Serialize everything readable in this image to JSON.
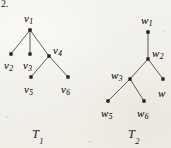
{
  "figure": {
    "item_number": "2.",
    "background_color": "#f2f0ea",
    "ink_color": "#24221f",
    "width": 171,
    "height": 148,
    "caption_left": "T",
    "caption_left_sub": "1",
    "caption_right": "T",
    "caption_right_sub": "2"
  },
  "trees": [
    {
      "id": "T1",
      "name_base": "T",
      "name_sub": "1",
      "name_x": 32,
      "name_y": 128,
      "nodes": [
        {
          "id": "v1",
          "base": "v",
          "sub": "1",
          "x": 30,
          "y": 30,
          "label_x": 24,
          "label_y": 13,
          "dot": 2.0
        },
        {
          "id": "v2",
          "base": "v",
          "sub": "2",
          "x": 11,
          "y": 54,
          "label_x": 4,
          "label_y": 60,
          "dot": 1.9
        },
        {
          "id": "v3",
          "base": "v",
          "sub": "3",
          "x": 30,
          "y": 54,
          "label_x": 23,
          "label_y": 60,
          "dot": 1.9
        },
        {
          "id": "v4",
          "base": "v",
          "sub": "4",
          "x": 49,
          "y": 56,
          "label_x": 53,
          "label_y": 45,
          "dot": 1.9
        },
        {
          "id": "v5",
          "base": "v",
          "sub": "5",
          "x": 31,
          "y": 77,
          "label_x": 24,
          "label_y": 84,
          "dot": 1.9
        },
        {
          "id": "v6",
          "base": "v",
          "sub": "6",
          "x": 68,
          "y": 77,
          "label_x": 61,
          "label_y": 84,
          "dot": 1.9
        }
      ],
      "edges": [
        {
          "from": "v1",
          "to": "v2"
        },
        {
          "from": "v1",
          "to": "v3"
        },
        {
          "from": "v1",
          "to": "v4"
        },
        {
          "from": "v4",
          "to": "v5"
        },
        {
          "from": "v4",
          "to": "v6"
        }
      ]
    },
    {
      "id": "T2",
      "name_base": "T",
      "name_sub": "2",
      "name_x": 128,
      "name_y": 128,
      "nodes": [
        {
          "id": "w1",
          "base": "w",
          "sub": "1",
          "x": 148,
          "y": 32,
          "label_x": 141,
          "label_y": 15,
          "dot": 2.0
        },
        {
          "id": "w2",
          "base": "w",
          "sub": "2",
          "x": 148,
          "y": 59,
          "label_x": 152,
          "label_y": 48,
          "dot": 1.9
        },
        {
          "id": "w3",
          "base": "w",
          "sub": "3",
          "x": 130,
          "y": 79,
          "label_x": 111,
          "label_y": 70,
          "dot": 1.9
        },
        {
          "id": "w4",
          "base": "w",
          "sub": "",
          "x": 163,
          "y": 79,
          "label_x": 158,
          "label_y": 88,
          "dot": 1.9
        },
        {
          "id": "w5",
          "base": "w",
          "sub": "5",
          "x": 108,
          "y": 101,
          "label_x": 101,
          "label_y": 108,
          "dot": 1.9
        },
        {
          "id": "w6",
          "base": "w",
          "sub": "6",
          "x": 144,
          "y": 101,
          "label_x": 137,
          "label_y": 108,
          "dot": 1.9
        }
      ],
      "edges": [
        {
          "from": "w1",
          "to": "w2"
        },
        {
          "from": "w2",
          "to": "w3"
        },
        {
          "from": "w2",
          "to": "w4"
        },
        {
          "from": "w3",
          "to": "w5"
        },
        {
          "from": "w3",
          "to": "w6"
        }
      ]
    }
  ]
}
